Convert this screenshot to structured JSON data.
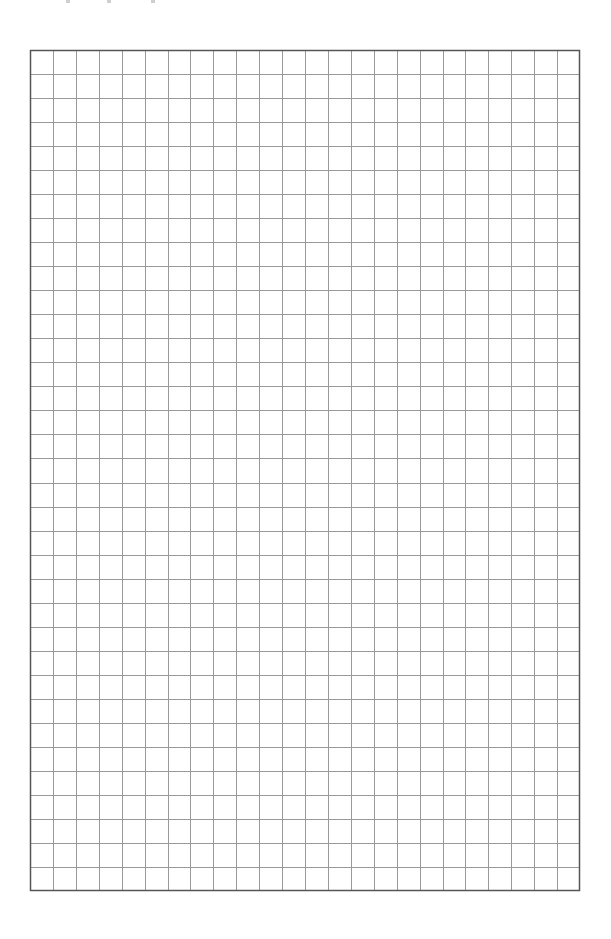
{
  "page": {
    "type": "graph-paper",
    "width": 611,
    "height": 939,
    "background": "#ffffff"
  },
  "top_cutoff_text": {
    "legible": false,
    "fragment_positions_x": [
      66,
      107,
      151
    ]
  },
  "grid": {
    "left": 30,
    "top": 50,
    "width": 550,
    "height": 841,
    "columns": 24,
    "rows": 35,
    "cell_width": 22.92,
    "cell_height": 24.03,
    "border_color": "#555555",
    "border_width": 1.5,
    "line_color": "#9a9a9a",
    "line_width": 1
  }
}
